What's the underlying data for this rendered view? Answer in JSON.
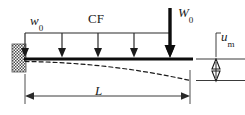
{
  "figure": {
    "name": "cantilever-beam-load-diagram",
    "type": "engineering-schematic",
    "background_color": "#ffffff",
    "line_color": "#1a1a1a",
    "dimension_line_color": "#3a3a3a"
  },
  "labels": {
    "distributed_load": {
      "symbol": "w",
      "subscript": "0",
      "italic": true
    },
    "load_case": {
      "text": "CF",
      "italic": false
    },
    "tip_load": {
      "symbol": "W",
      "subscript": "0",
      "italic": true
    },
    "tip_deflection": {
      "symbol": "u",
      "subscript": "m",
      "italic": true
    },
    "span": {
      "symbol": "L",
      "subscript": "",
      "italic": true
    }
  },
  "geometry": {
    "support": {
      "x": 12,
      "y": 44,
      "width": 14,
      "height": 28,
      "hatch": "cross-hatch"
    },
    "beam": {
      "x1": 25,
      "y1": 59,
      "x2": 193,
      "y2": 59,
      "thickness": 3
    },
    "load_rail": {
      "x1": 25,
      "y1": 33,
      "x2": 170,
      "y2": 33
    },
    "distributed_arrows_x": [
      25,
      62,
      98,
      134,
      170
    ],
    "distributed_arrow_top_y": 33,
    "distributed_arrow_bottom_y": 57,
    "tip_arrow": {
      "x": 170,
      "y_top": 8,
      "y_bottom": 57,
      "thickness": 4
    },
    "deflection_curve": {
      "x_start": 25,
      "y_start": 61,
      "x_end": 190,
      "y_end": 80,
      "dashed": true
    },
    "span_dimension": {
      "x1": 25,
      "x2": 190,
      "y": 96,
      "arrowheads": "both"
    },
    "deflection_dimension": {
      "x": 226,
      "y_top": 59,
      "y_bottom": 80,
      "arrowheads": "both"
    },
    "reference_line_top": {
      "x1": 196,
      "x2": 245,
      "y": 59
    },
    "reference_line_bottom": {
      "x1": 196,
      "x2": 245,
      "y": 80
    }
  }
}
